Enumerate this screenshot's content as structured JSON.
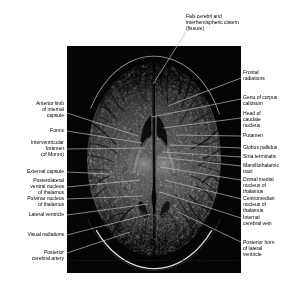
{
  "figure": {
    "type": "anatomical-plate",
    "modality": "axial brain section photograph",
    "background_color": "#ffffff",
    "plate_color": "#060606",
    "leader_color": "#b9b9b9",
    "label_color": "#000000"
  },
  "labels_top": [
    {
      "id": "falx-cerebri",
      "text": "Falx cerebri and\ninterhemispheric cistern\n(fissure)",
      "x": 186,
      "y": 14,
      "width": 96,
      "leader": [
        [
          186,
          32
        ],
        [
          153,
          84
        ]
      ]
    }
  ],
  "labels_left": [
    {
      "id": "anterior-limb-internal-capsule",
      "text": "Anterior limb\nof internal\ncapsule",
      "x": 2,
      "y": 101,
      "width": 62,
      "leader": [
        [
          67,
          113
        ],
        [
          138,
          136
        ]
      ]
    },
    {
      "id": "fornix",
      "text": "Fornix",
      "x": 2,
      "y": 128,
      "width": 62,
      "leader": [
        [
          67,
          131
        ],
        [
          142,
          143
        ]
      ]
    },
    {
      "id": "interventricular-foramen",
      "text": "Interventricular\nforamen\n(of Monro)",
      "x": 2,
      "y": 140,
      "width": 62,
      "leader": [
        [
          67,
          149
        ],
        [
          145,
          148
        ]
      ]
    },
    {
      "id": "external-capsule",
      "text": "External capsule",
      "x": 2,
      "y": 169,
      "width": 62,
      "leader": [
        [
          67,
          172
        ],
        [
          110,
          174
        ]
      ]
    },
    {
      "id": "posterolateral-ventral-nucleus",
      "text": "Posterolateral\nventral nucleus\nof thalamus",
      "x": 2,
      "y": 178,
      "width": 62,
      "leader": [
        [
          67,
          187
        ],
        [
          140,
          180
        ]
      ]
    },
    {
      "id": "pulvinar-nucleus",
      "text": "Pulvinar nucleus\nof thalamus",
      "x": 2,
      "y": 196,
      "width": 62,
      "leader": [
        [
          67,
          199
        ],
        [
          143,
          196
        ]
      ]
    },
    {
      "id": "lateral-ventricle",
      "text": "Lateral ventricle",
      "x": 2,
      "y": 212,
      "width": 62,
      "leader": [
        [
          67,
          215
        ],
        [
          148,
          204
        ]
      ]
    },
    {
      "id": "visual-radiations",
      "text": "Visual radiations",
      "x": 2,
      "y": 232,
      "width": 62,
      "leader": [
        [
          67,
          235
        ],
        [
          150,
          214
        ]
      ]
    },
    {
      "id": "posterior-cerebral-artery",
      "text": "Posterior\ncerebral artery",
      "x": 2,
      "y": 250,
      "width": 62,
      "leader": [
        [
          67,
          253
        ],
        [
          130,
          232
        ]
      ]
    }
  ],
  "labels_right": [
    {
      "id": "frontal-radiations",
      "text": "Frontal\nradiations",
      "x": 243,
      "y": 70,
      "width": 55,
      "leader": [
        [
          241,
          78
        ],
        [
          168,
          106
        ]
      ]
    },
    {
      "id": "genu-corpus-callosum",
      "text": "Genu of corpus\ncallosum",
      "x": 243,
      "y": 95,
      "width": 55,
      "leader": [
        [
          241,
          99
        ],
        [
          152,
          117
        ]
      ]
    },
    {
      "id": "head-caudate-nucleus",
      "text": "Head of\ncaudate\nnucleus",
      "x": 243,
      "y": 111,
      "width": 55,
      "leader": [
        [
          241,
          118
        ],
        [
          163,
          128
        ]
      ]
    },
    {
      "id": "putamen",
      "text": "Putamen",
      "x": 243,
      "y": 133,
      "width": 55,
      "leader": [
        [
          241,
          136
        ],
        [
          176,
          135
        ]
      ]
    },
    {
      "id": "globus-pallidus",
      "text": "Globus pallidus",
      "x": 243,
      "y": 145,
      "width": 55,
      "leader": [
        [
          241,
          148
        ],
        [
          170,
          145
        ]
      ]
    },
    {
      "id": "stria-terminalis",
      "text": "Stria terminalis",
      "x": 243,
      "y": 154,
      "width": 55,
      "leader": [
        [
          241,
          157
        ],
        [
          163,
          152
        ]
      ]
    },
    {
      "id": "mamillothalamic-tract",
      "text": "Mamillothalamic\ntract",
      "x": 243,
      "y": 163,
      "width": 55,
      "leader": [
        [
          241,
          166
        ],
        [
          158,
          157
        ]
      ]
    },
    {
      "id": "dorsal-medial-nucleus",
      "text": "Dorsal medial\nnucleus of\nthalamus",
      "x": 243,
      "y": 177,
      "width": 55,
      "leader": [
        [
          241,
          180
        ],
        [
          160,
          167
        ]
      ]
    },
    {
      "id": "centromedian-nucleus",
      "text": "Centromedian\nnucleus of\nthalamus",
      "x": 243,
      "y": 196,
      "width": 55,
      "leader": [
        [
          241,
          199
        ],
        [
          165,
          180
        ]
      ]
    },
    {
      "id": "internal-cerebral-vein",
      "text": "Internal\ncerebral vein",
      "x": 243,
      "y": 215,
      "width": 55,
      "leader": [
        [
          241,
          218
        ],
        [
          160,
          192
        ]
      ]
    },
    {
      "id": "posterior-horn-lateral-ventricle",
      "text": "Posterior horn\nof lateral\nventricle",
      "x": 243,
      "y": 240,
      "width": 55,
      "leader": [
        [
          241,
          242
        ],
        [
          178,
          212
        ]
      ]
    }
  ]
}
